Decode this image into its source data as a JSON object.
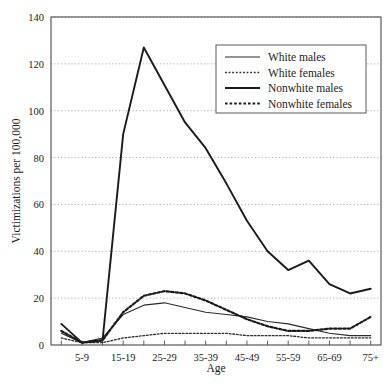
{
  "chart_data": {
    "type": "line",
    "title": "",
    "xlabel": "Age",
    "ylabel": "Victimizations per 100,000",
    "ylim": [
      0,
      140
    ],
    "ytick_step": 20,
    "yticks": [
      0,
      20,
      40,
      60,
      80,
      100,
      120,
      140
    ],
    "grid": true,
    "grid_style": "dotted-horizontal",
    "legend_position": "top-right",
    "categories": [
      "0-4",
      "5-9",
      "10-14",
      "15-19",
      "20-24",
      "25-29",
      "30-34",
      "35-39",
      "40-44",
      "45-49",
      "50-54",
      "55-59",
      "60-64",
      "65-69",
      "70-74",
      "75+"
    ],
    "xtick_labels_shown": [
      "5-9",
      "15-19",
      "25-29",
      "35-39",
      "45-49",
      "55-59",
      "65-69",
      "75+"
    ],
    "series": [
      {
        "name": "White males",
        "style": "thin-solid",
        "color": "#2b2b2b",
        "values": [
          5,
          1,
          3,
          13,
          17,
          18,
          16,
          14,
          13,
          12,
          10,
          9,
          7,
          5,
          4,
          4
        ]
      },
      {
        "name": "White females",
        "style": "thin-dotted",
        "color": "#2b2b2b",
        "values": [
          3,
          1,
          1,
          3,
          4,
          5,
          5,
          5,
          5,
          4,
          4,
          4,
          3,
          3,
          3,
          3
        ]
      },
      {
        "name": "Nonwhite males",
        "style": "thick-solid",
        "color": "#1a1a1a",
        "values": [
          9,
          1,
          2,
          90,
          127,
          111,
          95,
          84,
          69,
          53,
          40,
          32,
          36,
          26,
          22,
          24
        ]
      },
      {
        "name": "Nonwhite females",
        "style": "thick-dotted",
        "color": "#1a1a1a",
        "values": [
          6,
          1,
          2,
          14,
          21,
          23,
          22,
          19,
          15,
          11,
          8,
          6,
          6,
          7,
          7,
          12
        ]
      }
    ]
  },
  "legend": {
    "entries": [
      {
        "label": "White males"
      },
      {
        "label": "White females"
      },
      {
        "label": "Nonwhite males"
      },
      {
        "label": "Nonwhite females"
      }
    ]
  }
}
